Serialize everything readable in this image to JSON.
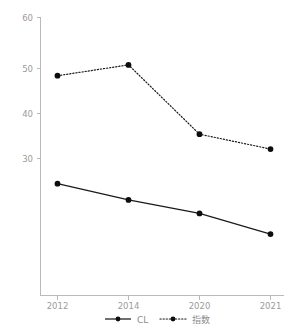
{
  "chart_data": {
    "type": "line",
    "title": "",
    "subtitle": "",
    "xlabel": "",
    "ylabel": "",
    "categories": [
      "2012",
      "2014",
      "2020",
      "2021"
    ],
    "x_tick_labels": [
      "2012",
      "2014",
      "2020",
      "2021"
    ],
    "y_tick_labels": [
      "60",
      "50",
      "40",
      "30"
    ],
    "y_ticks": [
      60,
      50,
      40,
      30
    ],
    "ylim": [
      0,
      60
    ],
    "xlim": [
      0,
      3
    ],
    "grid": false,
    "legend_position": "bottom",
    "series": [
      {
        "name": "CL",
        "style": "solid",
        "marker": "circle",
        "color": "#111111",
        "values": [
          24.4,
          20.8,
          17.8,
          13.2
        ]
      },
      {
        "name": "指数",
        "style": "dotted",
        "marker": "circle",
        "color": "#111111",
        "values": [
          48.4,
          50.8,
          35.4,
          32.1
        ]
      }
    ],
    "legend": [
      {
        "label": "CL",
        "style": "solid"
      },
      {
        "label": "指数",
        "style": "dotted"
      }
    ],
    "colors": {
      "axis": "#b9b9b9",
      "tick_text": "#9b9b9b",
      "series": "#111111",
      "background": "#ffffff"
    }
  },
  "axis": {
    "y_labels": {
      "t0": "60",
      "t1": "50",
      "t2": "40",
      "t3": "30"
    },
    "x_labels": {
      "t0": "2012",
      "t1": "2014",
      "t2": "2020",
      "t3": "2021"
    }
  },
  "legend": {
    "item0": "CL",
    "item1": "指数"
  }
}
